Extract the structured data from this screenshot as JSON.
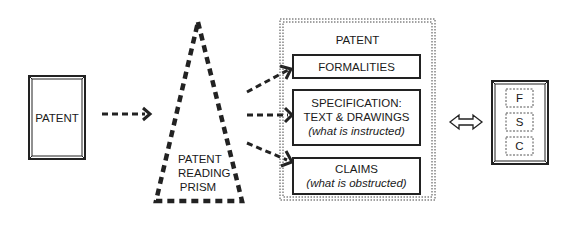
{
  "source_patent": {
    "label": "PATENT"
  },
  "prism": {
    "lines": [
      "PATENT",
      "READING",
      "PRISM"
    ]
  },
  "patent_container": {
    "title": "PATENT",
    "sections": [
      {
        "key": "formalities",
        "title": "FORMALITIES",
        "subtitle": ""
      },
      {
        "key": "specification",
        "title_line1": "SPECIFICATION:",
        "title_line2": "TEXT & DRAWINGS",
        "subtitle": "(what is instructed)"
      },
      {
        "key": "claims",
        "title": "CLAIMS",
        "subtitle": "(what is obstructed)"
      }
    ]
  },
  "equivalence_arrow": {
    "symbol": "⇔"
  },
  "summary_patent": {
    "letters": [
      "F",
      "S",
      "C"
    ]
  }
}
